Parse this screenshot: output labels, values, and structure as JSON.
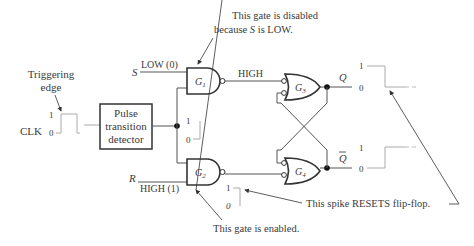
{
  "labels": {
    "triggering_edge_line1": "Triggering",
    "triggering_edge_line2": "edge",
    "clk": "CLK",
    "clk_high": "1",
    "clk_low": "0",
    "detector_line1": "Pulse",
    "detector_line2": "transition",
    "detector_line3": "detector",
    "s_input": "S",
    "s_value": "LOW (0)",
    "r_input": "R",
    "r_value": "HIGH (1)",
    "g1": "G",
    "g1_sub": "1",
    "g2": "G",
    "g2_sub": "2",
    "g3": "G",
    "g3_sub": "3",
    "g4": "G",
    "g4_sub": "4",
    "g1_output": "HIGH",
    "q": "Q",
    "q_bar": "Q",
    "spike_high": "1",
    "spike_low": "0",
    "g2out_high": "1",
    "g2out_low": "0",
    "q_high": "1",
    "q_low": "0",
    "qbar_high": "1",
    "qbar_low": "0"
  },
  "annotations": {
    "disabled_line1": "This gate is disabled",
    "disabled_line2_pre": "because ",
    "disabled_line2_var": "S",
    "disabled_line2_post": " is LOW.",
    "enabled": "This gate is enabled.",
    "spike_resets": "This spike RESETS flip-flop."
  }
}
